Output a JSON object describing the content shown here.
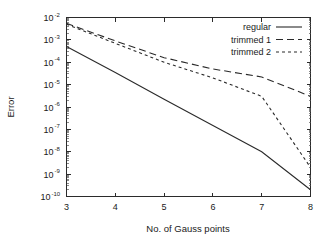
{
  "chart_data": {
    "type": "line",
    "title": "",
    "xlabel": "No. of Gauss points",
    "ylabel": "Error",
    "xlim": [
      3,
      8
    ],
    "ylim": [
      1e-10,
      0.01
    ],
    "yscale": "log",
    "xscale": "linear",
    "grid": false,
    "legend_position": "top-right",
    "xticks": [
      "3",
      "4",
      "5",
      "6",
      "7",
      "8"
    ],
    "xtick_values": [
      3,
      4,
      5,
      6,
      7,
      8
    ],
    "yticks": [
      "10^-2",
      "10^-3",
      "10^-4",
      "10^-5",
      "10^-6",
      "10^-7",
      "10^-8",
      "10^-9",
      "10^-10"
    ],
    "ytick_mantissa": "10",
    "ytick_exponents": [
      "-2",
      "-3",
      "-4",
      "-5",
      "-6",
      "-7",
      "-8",
      "-9",
      "-10"
    ],
    "ytick_values": [
      0.01,
      0.001,
      0.0001,
      1e-05,
      1e-06,
      1e-07,
      1e-08,
      1e-09,
      1e-10
    ],
    "x": [
      3,
      4,
      5,
      6,
      7,
      8
    ],
    "series": [
      {
        "name": "regular",
        "style": "solid",
        "color": "#2a2a2a",
        "values": [
          0.0005,
          3.5e-05,
          2.2e-06,
          1.5e-07,
          1e-08,
          2e-10
        ]
      },
      {
        "name": "trimmed 1",
        "style": "long-dash",
        "color": "#2a2a2a",
        "values": [
          0.0055,
          0.0009,
          0.00016,
          5e-05,
          2.2e-05,
          3e-06
        ]
      },
      {
        "name": "trimmed 2",
        "style": "short-dash",
        "color": "#2a2a2a",
        "values": [
          0.005,
          0.0007,
          0.0001,
          2e-05,
          3e-06,
          2e-09
        ]
      }
    ]
  },
  "legend": {
    "items": [
      {
        "label": "regular",
        "style": "solid"
      },
      {
        "label": "trimmed 1",
        "style": "long-dash"
      },
      {
        "label": "trimmed 2",
        "style": "short-dash"
      }
    ]
  },
  "axes": {
    "x_title": "No. of Gauss points",
    "y_title": "Error"
  }
}
